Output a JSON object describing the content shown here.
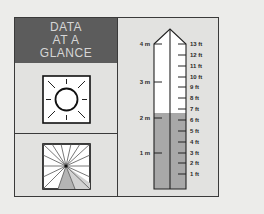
{
  "header": {
    "lines": [
      "DATA",
      "AT A",
      "GLANCE"
    ],
    "background": "#5c5c5c",
    "text_color": "#d6d6d6"
  },
  "icons": [
    {
      "name": "sun-icon",
      "description": "sun with rays in square box"
    },
    {
      "name": "sundial-fan-icon",
      "description": "radiating lines from center with shaded wedge"
    }
  ],
  "gauge": {
    "metric_labels": [
      "4 m",
      "3 m",
      "2 m",
      "1 m"
    ],
    "feet_labels": [
      "13 ft",
      "12 ft",
      "11 ft",
      "10 ft",
      "9 ft",
      "8 ft",
      "7 ft",
      "6 ft",
      "5 ft",
      "4 ft",
      "3 ft",
      "2 ft",
      "1 ft"
    ],
    "fill_level_m": 2.1,
    "fill_color": "#a8a8a8",
    "empty_color": "#ffffff"
  }
}
